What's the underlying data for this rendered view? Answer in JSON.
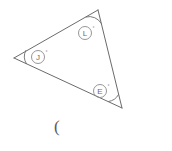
{
  "figure": {
    "type": "triangle-angle-diagram",
    "background_color": "#ffffff",
    "stroke_color": "#6b6b6b",
    "label_color": "#6d6d6d",
    "stroke_width": 1,
    "vertices": [
      {
        "name": "left-vertex",
        "x": 14,
        "y": 58
      },
      {
        "name": "top-vertex",
        "x": 98,
        "y": 10
      },
      {
        "name": "bottom-right-vertex",
        "x": 122,
        "y": 108
      }
    ],
    "sides": [
      {
        "name": "left-to-top",
        "from": "left-vertex",
        "to": "top-vertex"
      },
      {
        "name": "top-to-bottom-right",
        "from": "top-vertex",
        "to": "bottom-right-vertex"
      },
      {
        "name": "bottom-right-to-left",
        "from": "bottom-right-vertex",
        "to": "left-vertex"
      }
    ],
    "angles": [
      {
        "id": "angle-top",
        "vertex": "top-vertex",
        "label": "L",
        "degree_symbol": "°",
        "label_circle_center": {
          "x": 85,
          "y": 33
        },
        "label_circle_radius": 6.5,
        "arc_radius": 14
      },
      {
        "id": "angle-left",
        "vertex": "left-vertex",
        "label": "J",
        "degree_symbol": "°",
        "label_circle_center": {
          "x": 38,
          "y": 57
        },
        "label_circle_radius": 6.5,
        "arc_radius": 14
      },
      {
        "id": "angle-bottom-right",
        "vertex": "bottom-right-vertex",
        "label": "E",
        "degree_symbol": "°",
        "label_circle_center": {
          "x": 100,
          "y": 91
        },
        "label_circle_radius": 6.5,
        "arc_radius": 14
      }
    ]
  },
  "caption": {
    "text": "(",
    "x": 54,
    "y": 118
  }
}
